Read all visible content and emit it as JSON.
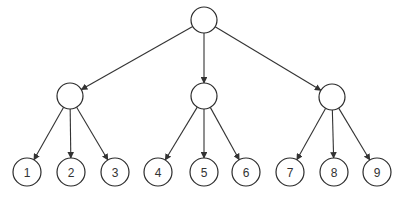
{
  "diagram": {
    "type": "tree",
    "colors": {
      "stroke": "#2b2b2b",
      "edge": "#333333",
      "background": "#ffffff"
    },
    "nodes": [
      {
        "id": "root",
        "label": "",
        "level": 0
      },
      {
        "id": "a",
        "label": "",
        "level": 1
      },
      {
        "id": "b",
        "label": "",
        "level": 1
      },
      {
        "id": "c",
        "label": "",
        "level": 1
      },
      {
        "id": "n1",
        "label": "1",
        "level": 2
      },
      {
        "id": "n2",
        "label": "2",
        "level": 2
      },
      {
        "id": "n3",
        "label": "3",
        "level": 2
      },
      {
        "id": "n4",
        "label": "4",
        "level": 2
      },
      {
        "id": "n5",
        "label": "5",
        "level": 2
      },
      {
        "id": "n6",
        "label": "6",
        "level": 2
      },
      {
        "id": "n7",
        "label": "7",
        "level": 2
      },
      {
        "id": "n8",
        "label": "8",
        "level": 2
      },
      {
        "id": "n9",
        "label": "9",
        "level": 2
      }
    ],
    "edges": [
      {
        "from": "root",
        "to": "a"
      },
      {
        "from": "root",
        "to": "b"
      },
      {
        "from": "root",
        "to": "c"
      },
      {
        "from": "a",
        "to": "n1"
      },
      {
        "from": "a",
        "to": "n2"
      },
      {
        "from": "a",
        "to": "n3"
      },
      {
        "from": "b",
        "to": "n4"
      },
      {
        "from": "b",
        "to": "n5"
      },
      {
        "from": "b",
        "to": "n6"
      },
      {
        "from": "c",
        "to": "n7"
      },
      {
        "from": "c",
        "to": "n8"
      },
      {
        "from": "c",
        "to": "n9"
      }
    ]
  }
}
